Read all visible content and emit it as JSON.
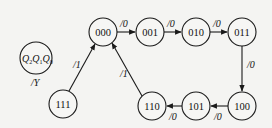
{
  "diagram": {
    "type": "state-transition-diagram",
    "legend": {
      "state_label": "Q2Q1Q0",
      "vars": [
        {
          "name": "Q",
          "sub": "2"
        },
        {
          "name": "Q",
          "sub": "1"
        },
        {
          "name": "Q",
          "sub": "0"
        }
      ],
      "output_label": "/Y"
    },
    "states": [
      {
        "id": "s000",
        "label": "000",
        "x": 103,
        "y": 32
      },
      {
        "id": "s001",
        "label": "001",
        "x": 150,
        "y": 32
      },
      {
        "id": "s010",
        "label": "010",
        "x": 196,
        "y": 32
      },
      {
        "id": "s011",
        "label": "011",
        "x": 242,
        "y": 32
      },
      {
        "id": "s100",
        "label": "100",
        "x": 242,
        "y": 106
      },
      {
        "id": "s101",
        "label": "101",
        "x": 196,
        "y": 106
      },
      {
        "id": "s110",
        "label": "110",
        "x": 152,
        "y": 106
      },
      {
        "id": "s111",
        "label": "111",
        "x": 63,
        "y": 104
      }
    ],
    "transitions": [
      {
        "from": "000",
        "to": "001",
        "label": "/0"
      },
      {
        "from": "001",
        "to": "010",
        "label": "/0"
      },
      {
        "from": "010",
        "to": "011",
        "label": "/0"
      },
      {
        "from": "011",
        "to": "100",
        "label": "/0"
      },
      {
        "from": "100",
        "to": "101",
        "label": "/0"
      },
      {
        "from": "101",
        "to": "110",
        "label": "/0"
      },
      {
        "from": "110",
        "to": "000",
        "label": "/1"
      },
      {
        "from": "111",
        "to": "000",
        "label": "/1"
      }
    ]
  }
}
